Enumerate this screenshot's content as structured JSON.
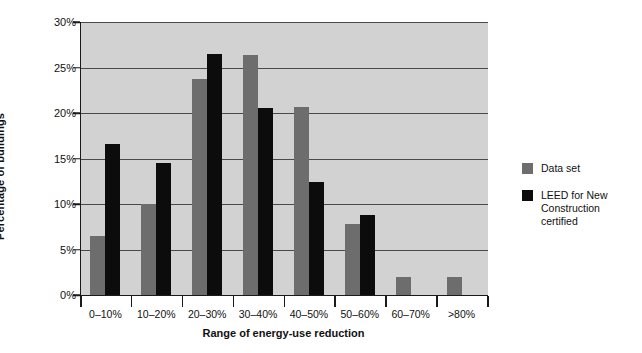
{
  "chart_data": {
    "type": "bar",
    "title": "",
    "xlabel": "Range of energy-use reduction",
    "ylabel": "Percentage of buildings",
    "categories": [
      "0–10%",
      "10–20%",
      "20–30%",
      "30–40%",
      "40–50%",
      "50–60%",
      "60–70%",
      ">80%"
    ],
    "series": [
      {
        "name": "Data set",
        "color": "#6d6d6d",
        "values": [
          6.5,
          10.0,
          23.7,
          26.4,
          20.7,
          7.8,
          2.0,
          2.0
        ]
      },
      {
        "name": "LEED for New Construction certified",
        "color": "#0c0c0c",
        "values": [
          16.6,
          14.5,
          26.5,
          20.5,
          12.4,
          8.8,
          0,
          0
        ]
      }
    ],
    "ylim": [
      0,
      30
    ],
    "yticks": [
      "0%",
      "5%",
      "10%",
      "15%",
      "20%",
      "25%",
      "30%"
    ],
    "ytick_values": [
      0,
      5,
      10,
      15,
      20,
      25,
      30
    ],
    "grid": true,
    "legend_position": "right",
    "plot_background": "#d2d2d2"
  },
  "legend": {
    "items": [
      {
        "label": "Data set",
        "swatch": "dataset"
      },
      {
        "label": "LEED for New\nConstruction\ncertified",
        "swatch": "leed"
      }
    ]
  }
}
